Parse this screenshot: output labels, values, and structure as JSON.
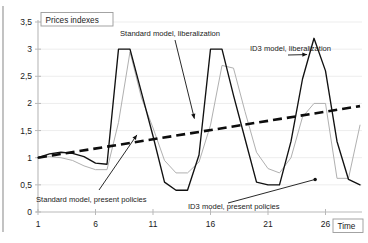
{
  "chart_data": {
    "type": "line",
    "title": "Prices indexes",
    "xlabel": "Time",
    "ylabel": "",
    "xlim": [
      1,
      29
    ],
    "ylim": [
      0,
      3.5
    ],
    "grid": true,
    "legend_position": "annotations-inline",
    "y_ticks": [
      "0",
      "0,5",
      "1",
      "1,5",
      "2",
      "2,5",
      "3",
      "3,5"
    ],
    "y_tick_values": [
      0,
      0.5,
      1,
      1.5,
      2,
      2.5,
      3,
      3.5
    ],
    "x_ticks": [
      "1",
      "6",
      "11",
      "16",
      "21",
      "26"
    ],
    "x_tick_values": [
      1,
      6,
      11,
      16,
      21,
      26
    ],
    "series": [
      {
        "name": "Standard model, liberalization",
        "color": "#111111",
        "style": "solid",
        "x": [
          1,
          2,
          3,
          4,
          5,
          6,
          7,
          8,
          9,
          10,
          11,
          12,
          13,
          14,
          15,
          16,
          17,
          18,
          19,
          20,
          21,
          22,
          23,
          24,
          25,
          26,
          27,
          28,
          29
        ],
        "values": [
          1.0,
          1.07,
          1.1,
          1.08,
          1.02,
          0.9,
          0.88,
          3.0,
          3.0,
          2.2,
          1.4,
          0.55,
          0.4,
          0.4,
          1.05,
          3.0,
          3.0,
          2.15,
          1.35,
          0.55,
          0.5,
          0.5,
          1.3,
          2.45,
          3.2,
          2.6,
          1.3,
          0.6,
          0.5
        ]
      },
      {
        "name": "ID3 model, liberalization",
        "color": "#b0b0b0",
        "style": "solid",
        "x": [
          1,
          2,
          3,
          4,
          5,
          6,
          7,
          8,
          9,
          10,
          11,
          12,
          13,
          14,
          15,
          16,
          17,
          18,
          19,
          20,
          21,
          22,
          23,
          24,
          25,
          26,
          27,
          28,
          29
        ],
        "values": [
          1.0,
          1.02,
          1.0,
          0.95,
          0.85,
          0.78,
          0.78,
          1.65,
          2.95,
          2.1,
          1.55,
          0.95,
          0.72,
          0.72,
          0.92,
          1.6,
          2.7,
          2.65,
          1.85,
          1.1,
          0.8,
          0.72,
          1.0,
          1.75,
          2.0,
          2.0,
          0.62,
          0.62,
          1.6
        ]
      },
      {
        "name": "Trend",
        "color": "#0d0d0d",
        "style": "dashed",
        "x": [
          1,
          29
        ],
        "values": [
          1.0,
          1.95
        ]
      }
    ],
    "annotations": [
      {
        "id": "standard-liberalization",
        "text": "Standard model,  liberalization",
        "target_x": 14.6,
        "target_y": 1.72
      },
      {
        "id": "id3-liberalization",
        "text": "ID3 model,  liberalization",
        "target_x": 24.4,
        "target_y": 2.9
      },
      {
        "id": "standard-present-policies",
        "text": "Standard model, present policies",
        "target_x": 9.6,
        "target_y": 1.42
      },
      {
        "id": "id3-present-policies",
        "text": "ID3 model, present policies",
        "target_x": 25.1,
        "target_y": 0.6
      }
    ]
  }
}
